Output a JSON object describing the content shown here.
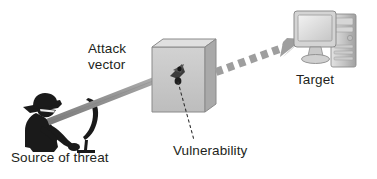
{
  "canvas": {
    "width": 377,
    "height": 179,
    "background": "#ffffff"
  },
  "diagram": {
    "type": "security-attack-flow",
    "title_text_color": "#231f20",
    "labels": {
      "attack_vector": "Attack\nvector",
      "target": "Target",
      "source_of_threat": "Source of threat",
      "vulnerability": "Vulnerability"
    },
    "nodes": [
      {
        "id": "source-of-threat",
        "icon": "hacker-silhouette-icon",
        "label": "Source of threat",
        "color": "#1a1a1a"
      },
      {
        "id": "barrier",
        "icon": "wall-block-icon",
        "label": "",
        "color": "#c9c9c9"
      },
      {
        "id": "target",
        "icon": "desktop-computer-icon",
        "label": "Target",
        "color": "#b4b4b4"
      }
    ],
    "connectors": [
      {
        "id": "attack-vector-arrow",
        "style": "solid-thick-shaft",
        "color": "#9a9a9a",
        "from": "source-of-threat",
        "to": "barrier"
      },
      {
        "id": "breach-arrow",
        "style": "dashed-thick-arrow",
        "color": "#9e9e9e",
        "from": "barrier",
        "to": "target"
      },
      {
        "id": "vulnerability-leader",
        "style": "dotted-thin-leader",
        "color": "#3a3a3a",
        "from": "vulnerability-point",
        "to": "vulnerability-label"
      }
    ],
    "colors": {
      "box_front": "#c5c5c5",
      "box_top": "#dcdcdc",
      "box_side": "#a8a8a8",
      "box_outline": "#7d7d7d",
      "arrow_grey": "#9a9a9a",
      "hacker_black": "#1a1a1a",
      "text": "#231f20",
      "impact_dot": "#262626"
    }
  }
}
